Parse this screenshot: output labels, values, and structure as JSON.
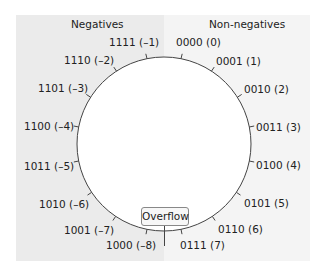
{
  "headings": {
    "negatives": "Negatives",
    "non_negatives": "Non-negatives"
  },
  "labels": [
    {
      "bits": "0000",
      "value": "0",
      "text": "0000 (0)"
    },
    {
      "bits": "0001",
      "value": "1",
      "text": "0001 (1)"
    },
    {
      "bits": "0010",
      "value": "2",
      "text": "0010 (2)"
    },
    {
      "bits": "0011",
      "value": "3",
      "text": "0011 (3)"
    },
    {
      "bits": "0100",
      "value": "4",
      "text": "0100 (4)"
    },
    {
      "bits": "0101",
      "value": "5",
      "text": "0101 (5)"
    },
    {
      "bits": "0110",
      "value": "6",
      "text": "0110 (6)"
    },
    {
      "bits": "0111",
      "value": "7",
      "text": "0111 (7)"
    },
    {
      "bits": "1000",
      "value": "-8",
      "text": "1000 (–8)"
    },
    {
      "bits": "1001",
      "value": "-7",
      "text": "1001 (–7)"
    },
    {
      "bits": "1010",
      "value": "-6",
      "text": "1010 (–6)"
    },
    {
      "bits": "1011",
      "value": "-5",
      "text": "1011 (–5)"
    },
    {
      "bits": "1100",
      "value": "-4",
      "text": "1100 (–4)"
    },
    {
      "bits": "1101",
      "value": "-3",
      "text": "1101 (–3)"
    },
    {
      "bits": "1110",
      "value": "-2",
      "text": "1110 (–2)"
    },
    {
      "bits": "1111",
      "value": "-1",
      "text": "1111 (–1)"
    }
  ],
  "overflow_label": "Overflow",
  "colors": {
    "negatives_bg": "#ebebeb",
    "non_negatives_bg": "#f4f4f4",
    "line": "#444444"
  }
}
